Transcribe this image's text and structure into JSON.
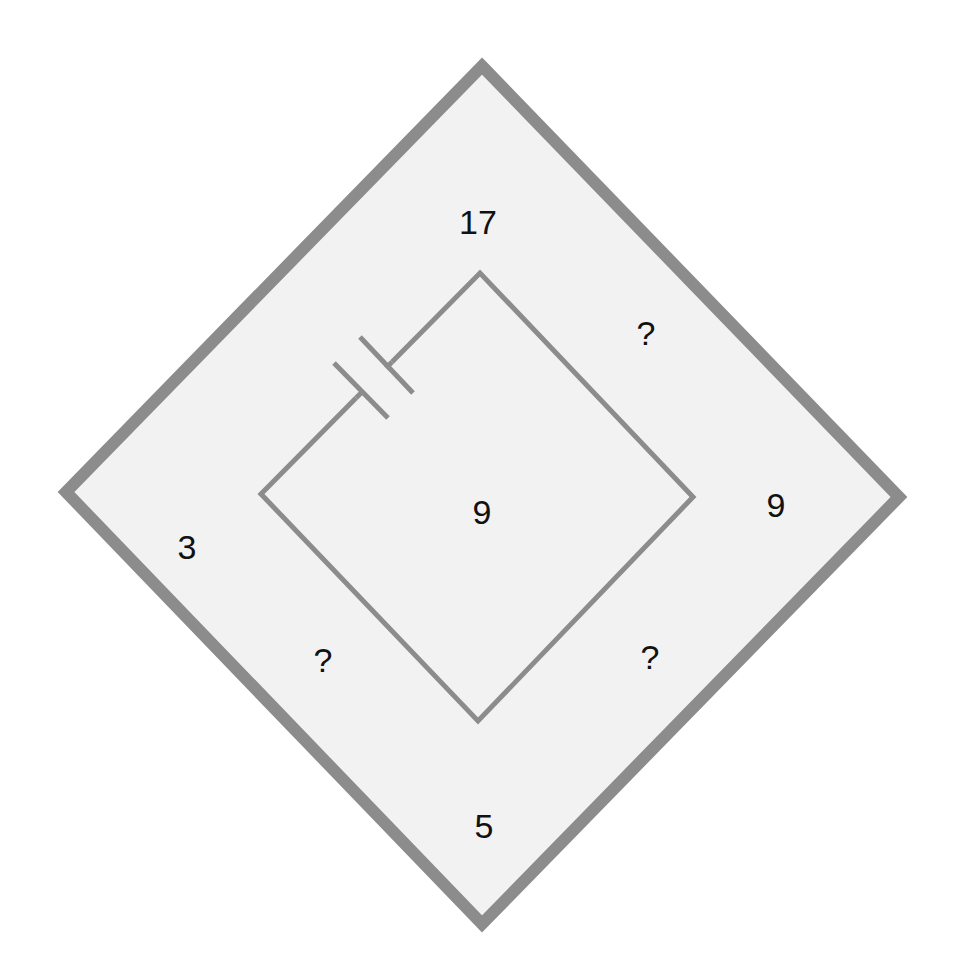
{
  "diagram": {
    "type": "number-puzzle-diamond",
    "colors": {
      "background": "#ffffff",
      "fill": "#f2f2f2",
      "stroke": "#8c8c8c",
      "text": "#111111"
    },
    "outer_diamond": {
      "top": [
        482,
        62
      ],
      "right": [
        903,
        497
      ],
      "bottom": [
        482,
        928
      ],
      "left": [
        62,
        492
      ]
    },
    "inner_diamond": {
      "top": [
        480,
        273
      ],
      "right": [
        693,
        497
      ],
      "bottom": [
        478,
        721
      ],
      "left": [
        261,
        494
      ]
    },
    "component": "capacitor-symbol",
    "labels": {
      "top": "17",
      "upper_right": "?",
      "right": "9",
      "center": "9",
      "left": "3",
      "lower_left": "?",
      "lower_right": "?",
      "bottom": "5"
    }
  }
}
